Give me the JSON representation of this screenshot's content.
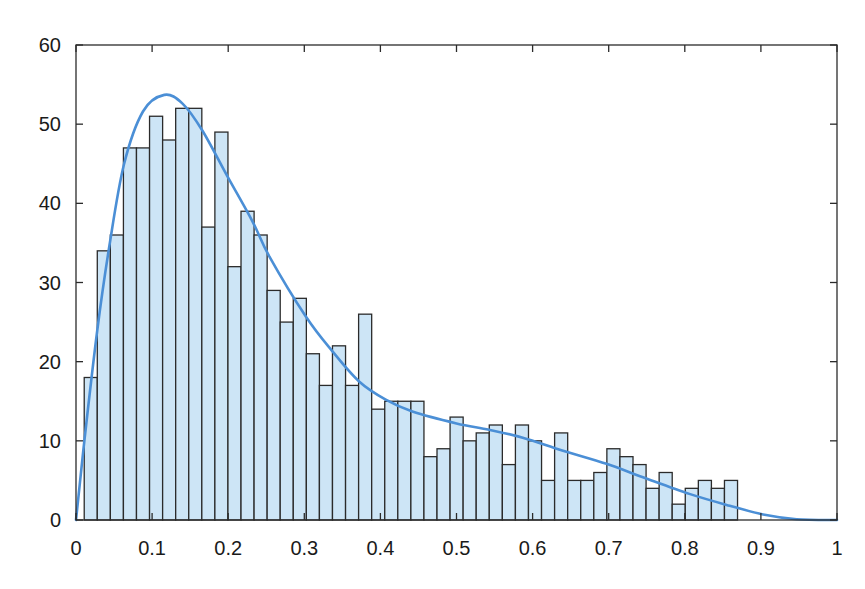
{
  "chart_data": {
    "type": "bar",
    "subtype": "histogram_with_density_fit",
    "title": "",
    "xlabel": "",
    "ylabel": "",
    "xlim": [
      0,
      1
    ],
    "ylim": [
      0,
      60
    ],
    "grid": false,
    "legend": null,
    "x_ticks": [
      0,
      0.1,
      0.2,
      0.3,
      0.4,
      0.5,
      0.6,
      0.7,
      0.8,
      0.9,
      1
    ],
    "x_tick_labels": [
      "0",
      "0.1",
      "0.2",
      "0.3",
      "0.4",
      "0.5",
      "0.6",
      "0.7",
      "0.8",
      "0.9",
      "1"
    ],
    "y_ticks": [
      0,
      10,
      20,
      30,
      40,
      50,
      60
    ],
    "y_tick_labels": [
      "0",
      "10",
      "20",
      "30",
      "40",
      "50",
      "60"
    ],
    "bins": {
      "start": 0.0108,
      "width": 0.01717,
      "count": 50
    },
    "series": [
      {
        "name": "histogram",
        "type": "bar",
        "values": [
          18,
          34,
          36,
          47,
          47,
          51,
          48,
          52,
          52,
          37,
          49,
          32,
          39,
          36,
          29,
          25,
          28,
          21,
          17,
          22,
          17,
          26,
          14,
          15,
          15,
          15,
          8,
          9,
          13,
          10,
          11,
          12,
          7,
          12,
          10,
          5,
          11,
          5,
          5,
          6,
          9,
          8,
          7,
          4,
          6,
          2,
          4,
          5,
          4,
          5
        ]
      },
      {
        "name": "fitted density",
        "type": "line",
        "x": [
          0,
          0.011,
          0.028,
          0.044,
          0.063,
          0.088,
          0.116,
          0.14,
          0.166,
          0.199,
          0.232,
          0.254,
          0.302,
          0.337,
          0.372,
          0.407,
          0.442,
          0.5,
          0.543,
          0.587,
          0.64,
          0.697,
          0.745,
          0.806,
          0.859,
          0.903,
          0.947,
          1.0
        ],
        "y": [
          0,
          10,
          24,
          34.7,
          44.9,
          51.6,
          53.7,
          52.6,
          49.2,
          43.4,
          37.7,
          33.3,
          25.7,
          21.3,
          17.5,
          15.2,
          13.7,
          12.2,
          11.4,
          10.4,
          8.75,
          7.1,
          5.4,
          3.3,
          1.8,
          0.7,
          0.1,
          0
        ]
      }
    ],
    "colors": {
      "bar_fill": "#cde5f6",
      "bar_edge": "#2b2b2b",
      "curve": "#4b8fd6",
      "axis": "#2b2b2b"
    }
  }
}
